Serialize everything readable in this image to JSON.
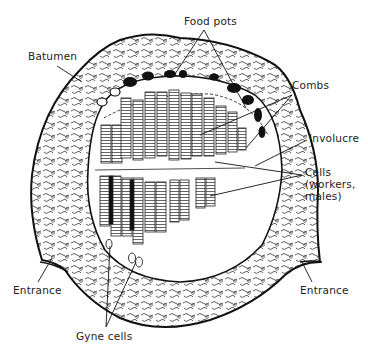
{
  "figure": {
    "colors": {
      "ink": "#1a1a1a",
      "background": "#ffffff",
      "text": "#222222"
    }
  },
  "labels": {
    "food_pots": "Food pots",
    "batumen": "Batumen",
    "combs": "Combs",
    "involucre": "Involucre",
    "cells_line1": "Cells",
    "cells_line2": "(workers,",
    "cells_line3": "males)",
    "entrance_left": "Entrance",
    "entrance_right": "Entrance",
    "gyne_cells": "Gyne cells"
  }
}
